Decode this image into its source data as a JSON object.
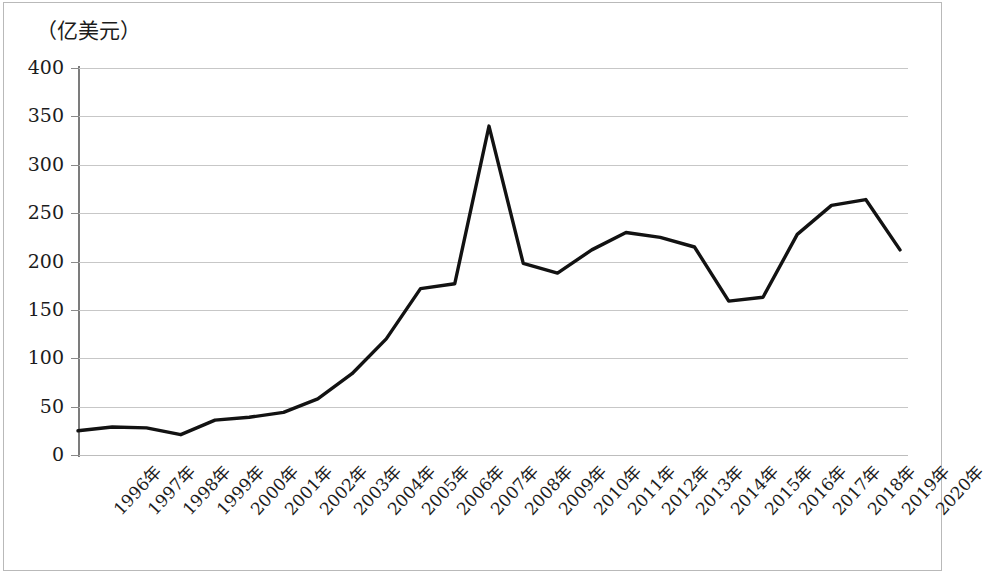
{
  "figure": {
    "unit_caption": "（亿美元）",
    "line_color": "#121212",
    "grid_color": "#c7c7c7",
    "axis_color": "#7c7c7c",
    "background": "#ffffff"
  },
  "chart_data": {
    "type": "line",
    "title": "",
    "subtitle": "",
    "xlabel": "",
    "ylabel": "（亿美元）",
    "unit": "亿美元",
    "grid": true,
    "legend": false,
    "ylim": [
      0,
      400
    ],
    "yticks": [
      0,
      50,
      100,
      150,
      200,
      250,
      300,
      350,
      400
    ],
    "ytick_labels": [
      "0",
      "50",
      "100",
      "150",
      "200",
      "250",
      "300",
      "350",
      "400"
    ],
    "categories": [
      "1996年",
      "1997年",
      "1998年",
      "1999年",
      "2000年",
      "2001年",
      "2002年",
      "2003年",
      "2004年",
      "2005年",
      "2006年",
      "2007年",
      "2008年",
      "2009年",
      "2010年",
      "2011年",
      "2012年",
      "2013年",
      "2014年",
      "2015年",
      "2016年",
      "2017年",
      "2018年",
      "2019年",
      "2020年"
    ],
    "values": [
      25,
      29,
      28,
      21,
      36,
      39,
      44,
      58,
      84,
      120,
      172,
      177,
      340,
      198,
      188,
      212,
      230,
      225,
      215,
      159,
      163,
      228,
      258,
      264,
      212
    ],
    "series": [
      {
        "name": "",
        "color": "#121212",
        "values": [
          25,
          29,
          28,
          21,
          36,
          39,
          44,
          58,
          84,
          120,
          172,
          177,
          340,
          198,
          188,
          212,
          230,
          225,
          215,
          159,
          163,
          228,
          258,
          264,
          212
        ]
      }
    ]
  }
}
